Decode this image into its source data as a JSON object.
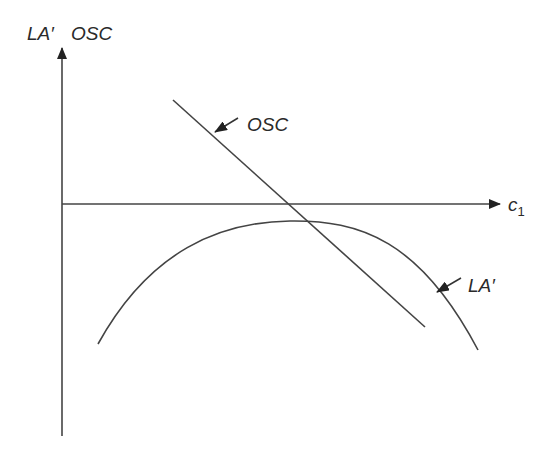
{
  "diagram": {
    "type": "economics-curve-diagram",
    "axes": {
      "y_label": "LA′, OSC",
      "y_label_part1": "LA′",
      "y_label_part2": "OSC",
      "x_label_main": "c",
      "x_label_sub": "1"
    },
    "curves": [
      {
        "id": "osc",
        "label": "OSC",
        "shape": "downward-sloping straight line"
      },
      {
        "id": "la_prime",
        "label": "LA′",
        "shape": "inverted-U concave curve below horizontal axis"
      }
    ],
    "colors": {
      "line": "#444444",
      "text": "#2a2a2a",
      "background": "#ffffff"
    }
  }
}
